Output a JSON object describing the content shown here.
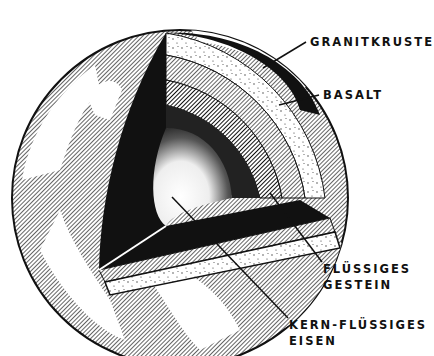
{
  "labels": {
    "granitkruste": "GRANITKRUSTE",
    "basalt": "BASALT",
    "fluessiges_gestein_1": "FLÜSSIGES",
    "fluessiges_gestein_2": "GESTEIN",
    "kern_1": "KERN-FLÜSSIGES",
    "kern_2": "EISEN"
  },
  "colors": {
    "ink": "#111111",
    "paper": "#ffffff",
    "hatch": "#555555"
  }
}
